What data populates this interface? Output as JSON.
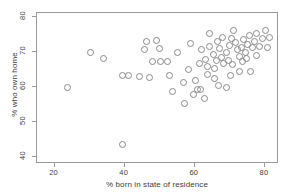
{
  "chart_data": {
    "type": "scatter",
    "title": "",
    "xlabel": "% born in state of residence",
    "ylabel": "% who own home",
    "xlim": [
      15,
      84
    ],
    "ylim": [
      38,
      81
    ],
    "xticks": [
      20,
      40,
      60,
      80
    ],
    "yticks": [
      40,
      50,
      60,
      70,
      80
    ],
    "grid": false,
    "legend": null,
    "marker": "open-circle",
    "marker_color": "#8a8a8a",
    "points": [
      {
        "x": 24.1,
        "y": 59.5
      },
      {
        "x": 30.4,
        "y": 69.6
      },
      {
        "x": 34.2,
        "y": 67.8
      },
      {
        "x": 39.6,
        "y": 63.0
      },
      {
        "x": 41.5,
        "y": 63.0
      },
      {
        "x": 39.8,
        "y": 43.2
      },
      {
        "x": 46.5,
        "y": 72.5
      },
      {
        "x": 46.0,
        "y": 70.3
      },
      {
        "x": 49.4,
        "y": 73.0
      },
      {
        "x": 50.2,
        "y": 70.6
      },
      {
        "x": 48.2,
        "y": 67.0
      },
      {
        "x": 50.4,
        "y": 66.8
      },
      {
        "x": 52.5,
        "y": 67.0
      },
      {
        "x": 44.4,
        "y": 62.5
      },
      {
        "x": 47.5,
        "y": 62.3
      },
      {
        "x": 53.2,
        "y": 63.0
      },
      {
        "x": 55.4,
        "y": 69.4
      },
      {
        "x": 57.2,
        "y": 55.0
      },
      {
        "x": 58.6,
        "y": 64.6
      },
      {
        "x": 60.5,
        "y": 61.5
      },
      {
        "x": 61.0,
        "y": 58.8
      },
      {
        "x": 59.0,
        "y": 72.0
      },
      {
        "x": 62.3,
        "y": 70.4
      },
      {
        "x": 63.2,
        "y": 67.6
      },
      {
        "x": 61.5,
        "y": 66.2
      },
      {
        "x": 63.8,
        "y": 65.4
      },
      {
        "x": 64.6,
        "y": 74.8
      },
      {
        "x": 65.5,
        "y": 68.9
      },
      {
        "x": 66.4,
        "y": 67.2
      },
      {
        "x": 65.8,
        "y": 65.0
      },
      {
        "x": 64.0,
        "y": 63.2
      },
      {
        "x": 67.2,
        "y": 70.5
      },
      {
        "x": 67.9,
        "y": 68.0
      },
      {
        "x": 68.6,
        "y": 66.2
      },
      {
        "x": 69.4,
        "y": 69.4
      },
      {
        "x": 70.1,
        "y": 71.5
      },
      {
        "x": 70.8,
        "y": 73.5
      },
      {
        "x": 71.4,
        "y": 75.8
      },
      {
        "x": 71.9,
        "y": 72.2
      },
      {
        "x": 72.4,
        "y": 70.2
      },
      {
        "x": 72.9,
        "y": 68.4
      },
      {
        "x": 73.5,
        "y": 71.0
      },
      {
        "x": 74.2,
        "y": 73.2
      },
      {
        "x": 74.8,
        "y": 69.6
      },
      {
        "x": 75.4,
        "y": 71.8
      },
      {
        "x": 76.0,
        "y": 74.4
      },
      {
        "x": 76.6,
        "y": 70.8
      },
      {
        "x": 77.3,
        "y": 72.6
      },
      {
        "x": 78.0,
        "y": 75.0
      },
      {
        "x": 78.8,
        "y": 71.2
      },
      {
        "x": 79.6,
        "y": 73.4
      },
      {
        "x": 80.4,
        "y": 75.6
      },
      {
        "x": 81.0,
        "y": 71.0
      },
      {
        "x": 81.6,
        "y": 73.8
      },
      {
        "x": 70.5,
        "y": 63.0
      },
      {
        "x": 73.0,
        "y": 64.2
      },
      {
        "x": 76.2,
        "y": 64.0
      },
      {
        "x": 67.0,
        "y": 60.2
      },
      {
        "x": 69.2,
        "y": 59.6
      },
      {
        "x": 66.0,
        "y": 62.0
      },
      {
        "x": 62.0,
        "y": 59.0
      },
      {
        "x": 59.8,
        "y": 57.5
      },
      {
        "x": 63.0,
        "y": 56.4
      },
      {
        "x": 57.0,
        "y": 61.0
      },
      {
        "x": 54.0,
        "y": 58.5
      },
      {
        "x": 68.2,
        "y": 73.8
      },
      {
        "x": 69.9,
        "y": 67.3
      },
      {
        "x": 75.0,
        "y": 67.8
      },
      {
        "x": 73.8,
        "y": 66.8
      },
      {
        "x": 71.0,
        "y": 66.0
      },
      {
        "x": 66.8,
        "y": 72.6
      },
      {
        "x": 64.4,
        "y": 71.2
      },
      {
        "x": 77.8,
        "y": 68.6
      }
    ]
  }
}
